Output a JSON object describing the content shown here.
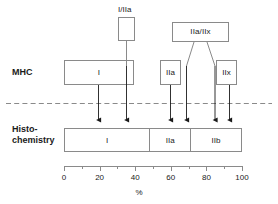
{
  "figure": {
    "rows": {
      "mhc_label": "MHC",
      "histo_label_line1": "Histo-",
      "histo_label_line2": "chemistry"
    },
    "top_boxes": [
      {
        "name": "i-iia",
        "label": "I/IIa",
        "caption": "I/IIa"
      },
      {
        "name": "iia-iix",
        "label": "IIa/IIx"
      }
    ],
    "mhc_boxes": [
      {
        "name": "mhc-i",
        "label": "I"
      },
      {
        "name": "mhc-iia",
        "label": "IIa"
      },
      {
        "name": "mhc-iix",
        "label": "IIx"
      }
    ],
    "histochemistry_segments": [
      {
        "name": "histo-seg-i",
        "label": "I",
        "start_pct": 0,
        "end_pct": 48
      },
      {
        "name": "histo-seg-iia",
        "label": "IIa",
        "start_pct": 48,
        "end_pct": 71
      },
      {
        "name": "histo-seg-iib",
        "label": "IIb",
        "start_pct": 71,
        "end_pct": 100
      }
    ],
    "axis": {
      "unit_label": "%",
      "min": 0,
      "max": 100,
      "major_ticks": [
        0,
        20,
        40,
        60,
        80,
        100
      ],
      "major_tick_labels": [
        "0",
        "20",
        "40",
        "60",
        "80",
        "100"
      ],
      "minor_ticks": [
        10,
        30,
        50,
        70,
        90
      ]
    },
    "arrows_pct": [
      19,
      40,
      60,
      69,
      85,
      93
    ],
    "colors": {
      "stroke": "#8a8a8a",
      "arrow": "#1a1a1a",
      "text": "#1a1a1a",
      "dashed_divider": "#8a8a8a",
      "background": "#ffffff"
    }
  }
}
